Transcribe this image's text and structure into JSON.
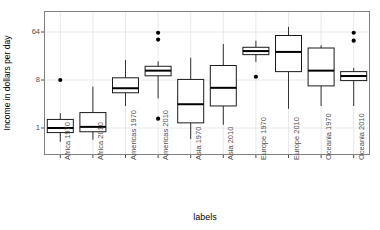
{
  "chart_data": {
    "type": "boxplot",
    "title": "",
    "xlabel": "labels",
    "ylabel": "Income in dollars per day",
    "yscale": "log2",
    "yticks": [
      1,
      8,
      64
    ],
    "ytick_labels": [
      "1",
      "8",
      "64"
    ],
    "ylim": [
      0.42,
      140
    ],
    "grid": true,
    "categories": [
      "Africa 1970",
      "Africa 2010",
      "Americas 1970",
      "Americas 2010",
      "Asia 1970",
      "Asia 2010",
      "Europe 1970",
      "Europe 2010",
      "Oceania 1970",
      "Oceania 2010"
    ],
    "boxes": [
      {
        "label": "Africa 1970",
        "lower_whisker": 1.9,
        "q1": 0.82,
        "median": 1.0,
        "q3": 1.45,
        "upper_whisker": 0.55,
        "outliers": [
          8.0
        ]
      },
      {
        "label": "Africa 2010",
        "lower_whisker": 0.6,
        "q1": 0.85,
        "median": 1.05,
        "q3": 1.95,
        "upper_whisker": 6.0,
        "outliers": []
      },
      {
        "label": "Americas 1970",
        "lower_whisker": 2.6,
        "q1": 4.6,
        "median": 5.6,
        "q3": 8.8,
        "upper_whisker": 19.0,
        "outliers": []
      },
      {
        "label": "Americas 2010",
        "lower_whisker": 3.6,
        "q1": 9.6,
        "median": 12.0,
        "q3": 14.5,
        "upper_whisker": 18.0,
        "outliers": [
          1.5,
          46.0,
          62.0
        ]
      },
      {
        "label": "Asia 1970",
        "lower_whisker": 0.62,
        "q1": 1.25,
        "median": 2.8,
        "q3": 8.2,
        "upper_whisker": 21.0,
        "outliers": []
      },
      {
        "label": "Asia 2010",
        "lower_whisker": 1.15,
        "q1": 2.6,
        "median": 5.7,
        "q3": 15.0,
        "upper_whisker": 38.0,
        "outliers": []
      },
      {
        "label": "Europe 1970",
        "lower_whisker": 17.5,
        "q1": 24.0,
        "median": 28.0,
        "q3": 33.0,
        "upper_whisker": 44.0,
        "outliers": [
          9.2
        ]
      },
      {
        "label": "Europe 2010",
        "lower_whisker": 2.3,
        "q1": 11.5,
        "median": 27.0,
        "q3": 55.0,
        "upper_whisker": 80.0,
        "outliers": []
      },
      {
        "label": "Oceania 1970",
        "lower_whisker": 2.6,
        "q1": 6.2,
        "median": 12.0,
        "q3": 32.0,
        "upper_whisker": 36.0,
        "outliers": []
      },
      {
        "label": "Oceania 2010",
        "lower_whisker": 2.6,
        "q1": 7.8,
        "median": 9.5,
        "q3": 11.5,
        "upper_whisker": 13.5,
        "outliers": [
          44.0,
          62.0
        ]
      }
    ],
    "colors": {
      "box_stroke": "#1a1a1a",
      "box_fill": "#ffffff",
      "median": "#000000",
      "whisker": "#333333",
      "outlier": "#000000",
      "panel_border": "#808080",
      "grid": "#e8e8e8",
      "tick_text": "#4d4d4d",
      "axis_title": "#000000",
      "background": "#ffffff"
    }
  },
  "axes": {
    "y_title": "Income in dollars per day",
    "x_title": "labels"
  }
}
